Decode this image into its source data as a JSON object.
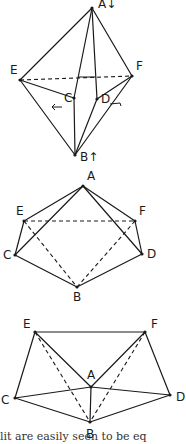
{
  "figures": [
    {
      "id": "fig1",
      "description": "Octahedron-like solid, A top, B bottom, with arrows showing folding directions",
      "points": {
        "A": [
          92,
          8
        ],
        "E": [
          20,
          80
        ],
        "F": [
          132,
          76
        ],
        "C": [
          74,
          98
        ],
        "D": [
          97,
          99
        ],
        "B": [
          75,
          155
        ]
      },
      "labels": {
        "A": "A↓",
        "E": "E",
        "F": "F",
        "C": "C",
        "D": "D",
        "B": "B↑"
      },
      "solid_edges": [
        [
          "A",
          "E"
        ],
        [
          "A",
          "F"
        ],
        [
          "A",
          "C"
        ],
        [
          "A",
          "D"
        ],
        [
          "E",
          "C"
        ],
        [
          "F",
          "D"
        ],
        [
          "E",
          "B"
        ],
        [
          "F",
          "B"
        ],
        [
          "C",
          "B"
        ],
        [
          "D",
          "B"
        ]
      ],
      "dashed_edges": [
        [
          "E",
          "F"
        ]
      ]
    },
    {
      "id": "fig2",
      "description": "Intermediate position",
      "points": {
        "A": [
          83,
          186
        ],
        "E": [
          24,
          221
        ],
        "F": [
          135,
          221
        ],
        "C": [
          15,
          255
        ],
        "D": [
          142,
          254
        ],
        "B": [
          77,
          287
        ]
      },
      "labels": {
        "A": "A",
        "E": "E",
        "F": "F",
        "C": "C",
        "D": "D",
        "B": "B"
      },
      "solid_edges": [
        [
          "A",
          "E"
        ],
        [
          "A",
          "F"
        ],
        [
          "A",
          "C"
        ],
        [
          "A",
          "D"
        ],
        [
          "E",
          "C"
        ],
        [
          "F",
          "D"
        ],
        [
          "C",
          "B"
        ],
        [
          "D",
          "B"
        ]
      ],
      "dashed_edges": [
        [
          "E",
          "F"
        ],
        [
          "E",
          "B"
        ],
        [
          "F",
          "B"
        ]
      ]
    },
    {
      "id": "fig3",
      "description": "Flattened position",
      "points": {
        "E": [
          35,
          332
        ],
        "F": [
          145,
          332
        ],
        "A": [
          91,
          387
        ],
        "C": [
          15,
          398
        ],
        "D": [
          170,
          395
        ],
        "B": [
          90,
          422
        ]
      },
      "labels": {
        "A": "A",
        "E": "E",
        "F": "F",
        "C": "C",
        "D": "D",
        "B": "B"
      },
      "solid_edges": [
        [
          "E",
          "F"
        ],
        [
          "E",
          "C"
        ],
        [
          "F",
          "D"
        ],
        [
          "E",
          "A"
        ],
        [
          "F",
          "A"
        ],
        [
          "C",
          "A"
        ],
        [
          "A",
          "D"
        ],
        [
          "C",
          "B"
        ],
        [
          "D",
          "B"
        ],
        [
          "A",
          "B"
        ]
      ],
      "dashed_edges": [
        [
          "E",
          "B"
        ],
        [
          "F",
          "B"
        ]
      ]
    }
  ],
  "caption": "lit are easily seen to be eq"
}
